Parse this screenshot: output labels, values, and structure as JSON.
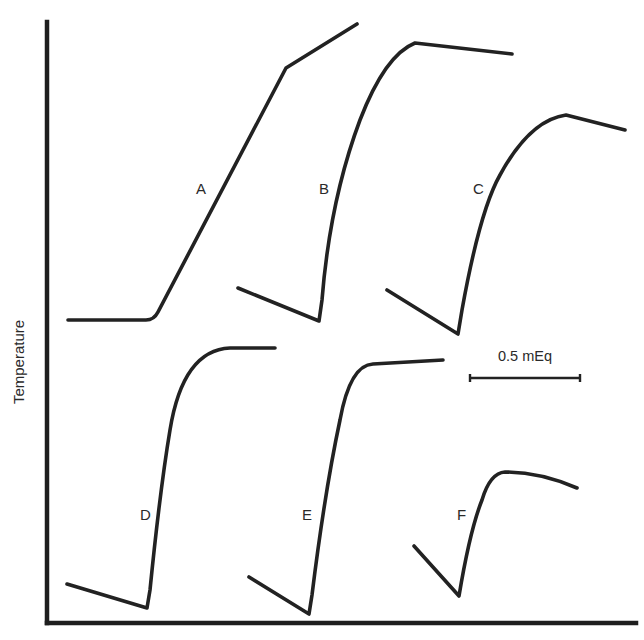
{
  "figure": {
    "y_axis_label": "Temperature",
    "x_axis_label": "",
    "scale_bar": {
      "label": "0.5 mEq",
      "x1": 470,
      "x2": 580,
      "y": 378
    },
    "axes": {
      "origin": [
        47,
        623
      ],
      "y_top": 22,
      "x_right": 636
    },
    "colors": {
      "line": "#222222",
      "text": "#2a2a2a",
      "background": "#ffffff"
    }
  },
  "chart_data": {
    "type": "line",
    "title": "",
    "xlabel": "",
    "ylabel": "Temperature",
    "grid": false,
    "legend": "none",
    "scale_annotation": "0.5 mEq",
    "series": [
      {
        "name": "A",
        "label_pos": [
          203,
          194
        ],
        "path": "M 68 320 L 146 320 Q 154 320 158 312 L 286 68 L 357 24",
        "points": [
          [
            68,
            320
          ],
          [
            146,
            320
          ],
          [
            158,
            312
          ],
          [
            286,
            68
          ],
          [
            357,
            24
          ]
        ]
      },
      {
        "name": "B",
        "label_pos": [
          325,
          192
        ],
        "path": "M 238 288 L 319 321 L 322 300 Q 330 200 360 120 Q 385 55 415 43 L 512 54",
        "points": [
          [
            238,
            288
          ],
          [
            319,
            321
          ],
          [
            340,
            200
          ],
          [
            360,
            120
          ],
          [
            415,
            43
          ],
          [
            512,
            54
          ]
        ]
      },
      {
        "name": "C",
        "label_pos": [
          480,
          192
        ],
        "path": "M 387 290 L 458 334 L 462 310 Q 480 210 500 175 Q 530 120 566 115 L 625 130",
        "points": [
          [
            387,
            290
          ],
          [
            458,
            334
          ],
          [
            478,
            210
          ],
          [
            566,
            115
          ],
          [
            625,
            130
          ]
        ]
      },
      {
        "name": "D",
        "label_pos": [
          146,
          516
        ],
        "path": "M 67 584 L 147 608 L 150 590 Q 160 490 170 430 Q 183 350 230 348 L 275 348",
        "points": [
          [
            67,
            584
          ],
          [
            147,
            608
          ],
          [
            165,
            490
          ],
          [
            183,
            380
          ],
          [
            230,
            348
          ],
          [
            275,
            348
          ]
        ]
      },
      {
        "name": "E",
        "label_pos": [
          308,
          516
        ],
        "path": "M 249 577 L 309 614 L 312 595 Q 325 490 340 420 Q 350 365 373 364 L 443 360",
        "points": [
          [
            249,
            577
          ],
          [
            309,
            614
          ],
          [
            325,
            490
          ],
          [
            345,
            390
          ],
          [
            373,
            364
          ],
          [
            443,
            360
          ]
        ]
      },
      {
        "name": "F",
        "label_pos": [
          462,
          515
        ],
        "path": "M 414 546 L 459 596 Q 470 530 482 500 Q 490 473 505 472 Q 540 472 577 488",
        "points": [
          [
            414,
            546
          ],
          [
            459,
            596
          ],
          [
            475,
            520
          ],
          [
            505,
            472
          ],
          [
            577,
            488
          ]
        ]
      }
    ]
  }
}
